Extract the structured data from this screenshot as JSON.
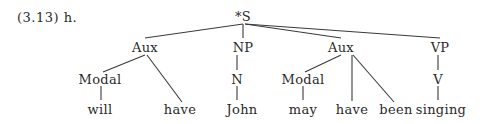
{
  "example_label": "(3.13) h.",
  "tree": {
    "root": "*S",
    "aux1": "Aux",
    "np": "NP",
    "aux2": "Aux",
    "vp": "VP",
    "modal1": "Modal",
    "will": "will",
    "have1": "have",
    "n": "N",
    "john": "John",
    "modal2": "Modal",
    "may": "may",
    "have2": "have",
    "been": "been",
    "v": "V",
    "singing": "singing"
  }
}
